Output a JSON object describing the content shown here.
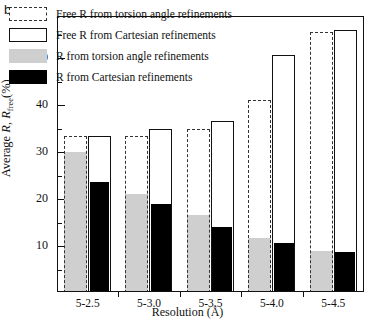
{
  "panel": {
    "label": "b"
  },
  "chart_data": {
    "type": "bar",
    "title": "",
    "xlabel": "Resolution (Å)",
    "ylabel": "Average R, Rfree(%)",
    "ylabel_parts": {
      "prefix": "Average ",
      "sym1": "R",
      "mid": ", ",
      "sym2": "R",
      "sub": "free",
      "suffix": "(%)"
    },
    "categories": [
      "5-2.5",
      "5-3.0",
      "5-3.5",
      "5-4.0",
      "5-4.5"
    ],
    "ylim": [
      0,
      60
    ],
    "yticks_major": [
      10,
      20,
      30,
      40,
      50
    ],
    "yticks_minor": [
      5,
      15,
      25,
      35,
      45,
      55
    ],
    "grid": false,
    "legend_position": "top-left",
    "series": [
      {
        "name": "Free R from torsion angle refinements",
        "style": "dashed-outline",
        "color": "#333333",
        "fill": "none",
        "values": [
          33.5,
          33.5,
          35.0,
          41.0,
          55.5
        ]
      },
      {
        "name": "Free R from Cartesian refinements",
        "style": "solid-outline",
        "color": "#111111",
        "fill": "#ffffff",
        "values": [
          33.5,
          35.0,
          36.5,
          50.7,
          56.0
        ]
      },
      {
        "name": "R from torsion angle refinements",
        "style": "filled",
        "color": "#cfcfcf",
        "fill": "#cfcfcf",
        "values": [
          30.0,
          21.0,
          16.5,
          11.7,
          9.0
        ]
      },
      {
        "name": "R from Cartesian refinements",
        "style": "filled",
        "color": "#000000",
        "fill": "#000000",
        "values": [
          23.7,
          19.0,
          14.0,
          10.7,
          8.8
        ]
      }
    ]
  },
  "legend": {
    "items": [
      {
        "label": "Free R from torsion angle refinements",
        "swatch": "dashed-outline-swatch"
      },
      {
        "label": "Free R from Cartesian refinements",
        "swatch": "open-outline-swatch"
      },
      {
        "label": "R from torsion angle refinements",
        "swatch": "gray-fill-swatch"
      },
      {
        "label": "R from Cartesian refinements",
        "swatch": "black-fill-swatch"
      }
    ]
  }
}
